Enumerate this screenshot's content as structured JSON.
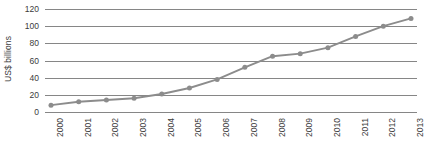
{
  "chart": {
    "y_axis_title": "US$ billions"
  },
  "chart_data": {
    "type": "line",
    "title": "",
    "subtitle": "",
    "xlabel": "",
    "ylabel": "US$ billions",
    "categories": [
      "2000",
      "2001",
      "2002",
      "2003",
      "2004",
      "2005",
      "2006",
      "2007",
      "2008",
      "2009",
      "2010",
      "2011",
      "2012",
      "2013"
    ],
    "values": [
      8,
      12,
      14,
      16,
      21,
      28,
      38,
      52,
      65,
      68,
      75,
      88,
      100,
      109
    ],
    "series": [
      {
        "name": "US$ billions",
        "values": [
          8,
          12,
          14,
          16,
          21,
          28,
          38,
          52,
          65,
          68,
          75,
          88,
          100,
          109
        ]
      }
    ],
    "ylim": [
      0,
      120
    ],
    "yticks": [
      0,
      20,
      40,
      60,
      80,
      100,
      120
    ],
    "ytick_labels": [
      "0",
      "20",
      "40",
      "60",
      "80",
      "100",
      "120"
    ],
    "grid": true,
    "legend": false,
    "legend_position": "none",
    "line_color": "#8c8c8c",
    "marker_color": "#8c8c8c",
    "grid_color": "#868686",
    "text_color": "#3b3b3b",
    "marker": "circle",
    "annotations": []
  }
}
